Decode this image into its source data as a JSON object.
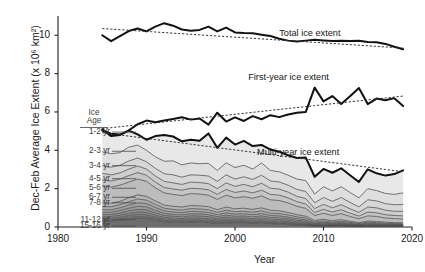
{
  "chart_data": {
    "type": "area",
    "title": "",
    "xlabel": "Year",
    "ylabel": "Dec-Feb Average Ice Extent (x 10⁶ km²)",
    "xlim": [
      1980,
      2020
    ],
    "ylim": [
      0,
      10.9
    ],
    "xticks": [
      1980,
      1990,
      2000,
      2010,
      2020
    ],
    "yticks": [
      0,
      2,
      4,
      6,
      8,
      10
    ],
    "grid": false,
    "legend_position": "inside-left",
    "x": [
      1985,
      1986,
      1987,
      1988,
      1989,
      1990,
      1991,
      1992,
      1993,
      1994,
      1995,
      1996,
      1997,
      1998,
      1999,
      2000,
      2001,
      2002,
      2003,
      2004,
      2005,
      2006,
      2007,
      2008,
      2009,
      2010,
      2011,
      2012,
      2013,
      2014,
      2015,
      2016,
      2017,
      2018,
      2019
    ],
    "series": [
      {
        "name": "Total ice extent",
        "style": "thick-solid",
        "values": [
          10.0,
          9.69,
          9.95,
          10.22,
          10.35,
          10.2,
          10.45,
          10.63,
          10.5,
          10.3,
          10.23,
          10.28,
          10.45,
          10.2,
          10.4,
          10.15,
          10.12,
          10.1,
          10.03,
          9.96,
          9.82,
          9.72,
          9.67,
          9.72,
          9.77,
          9.73,
          9.7,
          9.72,
          9.7,
          9.71,
          9.65,
          9.63,
          9.55,
          9.4,
          9.27
        ]
      },
      {
        "name": "Total ice extent trend",
        "style": "dotted-trend",
        "values": [
          10.35,
          10.32,
          10.29,
          10.26,
          10.23,
          10.2,
          10.17,
          10.14,
          10.11,
          10.08,
          10.05,
          10.02,
          9.99,
          9.96,
          9.93,
          9.9,
          9.87,
          9.84,
          9.81,
          9.78,
          9.75,
          9.72,
          9.69,
          9.66,
          9.63,
          9.6,
          9.57,
          9.54,
          9.51,
          9.48,
          9.45,
          9.42,
          9.39,
          9.36,
          9.33
        ]
      },
      {
        "name": "First-year ice extent",
        "style": "thick-solid",
        "values": [
          5.1,
          4.74,
          4.8,
          5.04,
          5.36,
          5.55,
          5.46,
          5.55,
          5.63,
          5.72,
          5.6,
          5.66,
          5.34,
          5.96,
          5.5,
          5.72,
          5.53,
          5.78,
          5.62,
          5.83,
          5.73,
          5.87,
          5.96,
          6.0,
          7.27,
          6.55,
          6.83,
          6.42,
          6.82,
          7.25,
          6.41,
          6.7,
          6.61,
          6.72,
          6.31
        ]
      },
      {
        "name": "First-year ice extent trend",
        "style": "dotted-trend",
        "values": [
          5.13,
          5.18,
          5.23,
          5.28,
          5.33,
          5.38,
          5.43,
          5.48,
          5.53,
          5.58,
          5.63,
          5.68,
          5.73,
          5.78,
          5.83,
          5.88,
          5.93,
          5.98,
          6.03,
          6.08,
          6.13,
          6.18,
          6.23,
          6.28,
          6.33,
          6.38,
          6.43,
          6.48,
          6.53,
          6.58,
          6.63,
          6.68,
          6.73,
          6.78,
          6.83
        ]
      },
      {
        "name": "Multi-year ice extent",
        "style": "thick-solid",
        "values": [
          5.03,
          4.86,
          4.82,
          5.03,
          4.83,
          4.55,
          4.74,
          4.8,
          4.72,
          4.47,
          4.55,
          4.5,
          4.88,
          4.13,
          4.66,
          4.3,
          4.49,
          4.22,
          4.28,
          4.04,
          3.93,
          3.74,
          3.6,
          3.62,
          2.62,
          3.03,
          2.83,
          3.06,
          2.7,
          2.35,
          3.01,
          2.8,
          2.68,
          2.76,
          2.95
        ]
      },
      {
        "name": "Multi-year ice extent trend",
        "style": "dotted-trend",
        "values": [
          4.92,
          4.86,
          4.8,
          4.74,
          4.68,
          4.62,
          4.56,
          4.5,
          4.44,
          4.38,
          4.32,
          4.26,
          4.2,
          4.14,
          4.08,
          4.02,
          3.96,
          3.9,
          3.84,
          3.78,
          3.72,
          3.66,
          3.6,
          3.54,
          3.48,
          3.42,
          3.36,
          3.3,
          3.24,
          3.18,
          3.12,
          3.06,
          3.0,
          2.94,
          2.88
        ]
      }
    ],
    "stacked_bands": [
      {
        "label": "1-2 yr",
        "values": [
          5.03,
          4.86,
          4.82,
          5.03,
          4.83,
          4.55,
          4.74,
          4.8,
          4.72,
          4.47,
          4.55,
          4.5,
          4.88,
          4.13,
          4.66,
          4.3,
          4.49,
          4.22,
          4.28,
          4.04,
          3.93,
          3.74,
          3.6,
          3.62,
          2.62,
          3.03,
          2.83,
          3.06,
          2.7,
          2.35,
          3.01,
          2.8,
          2.68,
          2.76,
          2.95
        ]
      },
      {
        "label": "2-3 yr",
        "values": [
          3.92,
          3.82,
          3.88,
          4.16,
          4.27,
          4.0,
          3.66,
          3.43,
          3.45,
          3.24,
          3.34,
          3.3,
          3.32,
          2.95,
          3.35,
          3.1,
          3.22,
          3.02,
          3.34,
          2.95,
          2.88,
          2.7,
          2.5,
          2.42,
          1.72,
          2.1,
          1.88,
          2.1,
          1.8,
          1.52,
          2.0,
          1.9,
          1.75,
          1.7,
          1.78
        ]
      },
      {
        "label": "3-4 yr",
        "values": [
          3.2,
          3.12,
          3.22,
          3.44,
          3.6,
          3.4,
          3.06,
          2.78,
          2.72,
          2.6,
          2.72,
          2.7,
          2.66,
          2.38,
          2.72,
          2.5,
          2.62,
          2.48,
          2.7,
          2.4,
          2.35,
          2.18,
          1.96,
          1.85,
          1.26,
          1.54,
          1.34,
          1.54,
          1.28,
          1.05,
          1.42,
          1.36,
          1.22,
          1.16,
          1.18
        ]
      },
      {
        "label": "4-5 yr",
        "values": [
          2.8,
          2.72,
          2.82,
          3.02,
          3.18,
          3.02,
          2.66,
          2.38,
          2.3,
          2.22,
          2.34,
          2.32,
          2.26,
          2.0,
          2.3,
          2.12,
          2.22,
          2.1,
          2.28,
          2.02,
          1.98,
          1.82,
          1.6,
          1.48,
          0.96,
          1.18,
          1.0,
          1.16,
          0.95,
          0.76,
          1.04,
          1.0,
          0.88,
          0.82,
          0.82
        ]
      },
      {
        "label": "5-6 yr",
        "values": [
          2.46,
          2.4,
          2.5,
          2.68,
          2.84,
          2.7,
          2.34,
          2.06,
          1.98,
          1.92,
          2.02,
          2.0,
          1.94,
          1.7,
          1.96,
          1.8,
          1.88,
          1.78,
          1.92,
          1.7,
          1.66,
          1.52,
          1.32,
          1.2,
          0.76,
          0.92,
          0.78,
          0.9,
          0.72,
          0.57,
          0.78,
          0.74,
          0.64,
          0.6,
          0.58
        ]
      },
      {
        "label": "6-7 yr",
        "values": [
          2.14,
          2.08,
          2.18,
          2.34,
          2.5,
          2.38,
          2.04,
          1.78,
          1.7,
          1.64,
          1.74,
          1.72,
          1.66,
          1.44,
          1.66,
          1.52,
          1.58,
          1.5,
          1.62,
          1.42,
          1.38,
          1.26,
          1.08,
          0.97,
          0.6,
          0.72,
          0.6,
          0.7,
          0.55,
          0.43,
          0.58,
          0.55,
          0.47,
          0.44,
          0.42
        ]
      },
      {
        "label": "7-8 yr",
        "values": [
          1.26,
          1.24,
          1.34,
          1.52,
          1.68,
          1.6,
          1.36,
          1.14,
          1.08,
          1.04,
          1.12,
          1.1,
          1.06,
          0.9,
          1.04,
          0.95,
          0.98,
          0.92,
          1.0,
          0.87,
          0.84,
          0.76,
          0.64,
          0.56,
          0.34,
          0.4,
          0.33,
          0.38,
          0.3,
          0.23,
          0.31,
          0.29,
          0.25,
          0.23,
          0.22
        ]
      },
      {
        "label": "8-9 yr",
        "values": [
          1.06,
          1.06,
          1.16,
          1.32,
          1.46,
          1.4,
          1.18,
          0.98,
          0.92,
          0.88,
          0.96,
          0.94,
          0.9,
          0.76,
          0.88,
          0.8,
          0.82,
          0.77,
          0.84,
          0.72,
          0.7,
          0.63,
          0.53,
          0.46,
          0.27,
          0.32,
          0.26,
          0.3,
          0.24,
          0.18,
          0.25,
          0.23,
          0.2,
          0.18,
          0.17
        ]
      },
      {
        "label": "9-10 yr",
        "values": [
          0.9,
          0.9,
          1.0,
          1.14,
          1.26,
          1.22,
          1.02,
          0.84,
          0.78,
          0.75,
          0.82,
          0.8,
          0.76,
          0.64,
          0.74,
          0.67,
          0.69,
          0.64,
          0.7,
          0.6,
          0.58,
          0.52,
          0.43,
          0.37,
          0.21,
          0.25,
          0.21,
          0.24,
          0.19,
          0.14,
          0.2,
          0.18,
          0.16,
          0.14,
          0.13
        ]
      },
      {
        "label": "10-11 yr",
        "values": [
          0.76,
          0.77,
          0.86,
          0.98,
          1.08,
          1.05,
          0.87,
          0.71,
          0.66,
          0.63,
          0.69,
          0.68,
          0.64,
          0.54,
          0.62,
          0.56,
          0.57,
          0.53,
          0.58,
          0.5,
          0.48,
          0.43,
          0.35,
          0.3,
          0.17,
          0.2,
          0.17,
          0.19,
          0.15,
          0.11,
          0.16,
          0.14,
          0.12,
          0.11,
          0.1
        ]
      },
      {
        "label": "11-12 yr",
        "values": [
          0.64,
          0.65,
          0.73,
          0.84,
          0.92,
          0.9,
          0.74,
          0.6,
          0.56,
          0.53,
          0.58,
          0.57,
          0.54,
          0.45,
          0.52,
          0.47,
          0.47,
          0.44,
          0.48,
          0.41,
          0.39,
          0.35,
          0.28,
          0.24,
          0.13,
          0.16,
          0.13,
          0.15,
          0.12,
          0.09,
          0.12,
          0.11,
          0.1,
          0.09,
          0.08
        ]
      },
      {
        "label": "12-13 yr",
        "values": [
          0.53,
          0.55,
          0.62,
          0.71,
          0.78,
          0.76,
          0.62,
          0.5,
          0.46,
          0.44,
          0.48,
          0.47,
          0.44,
          0.37,
          0.43,
          0.38,
          0.38,
          0.36,
          0.39,
          0.33,
          0.32,
          0.28,
          0.22,
          0.19,
          0.1,
          0.12,
          0.1,
          0.12,
          0.09,
          0.07,
          0.09,
          0.08,
          0.07,
          0.07,
          0.06
        ]
      },
      {
        "label": "13-14 yr",
        "values": [
          0.44,
          0.46,
          0.52,
          0.6,
          0.65,
          0.64,
          0.52,
          0.41,
          0.38,
          0.36,
          0.39,
          0.38,
          0.36,
          0.3,
          0.35,
          0.31,
          0.31,
          0.29,
          0.31,
          0.26,
          0.25,
          0.22,
          0.17,
          0.15,
          0.08,
          0.09,
          0.08,
          0.09,
          0.07,
          0.05,
          0.07,
          0.06,
          0.05,
          0.05,
          0.05
        ]
      },
      {
        "label": "14-15 yr",
        "values": [
          0.36,
          0.38,
          0.43,
          0.5,
          0.54,
          0.53,
          0.43,
          0.34,
          0.31,
          0.29,
          0.32,
          0.31,
          0.29,
          0.24,
          0.28,
          0.25,
          0.25,
          0.23,
          0.25,
          0.21,
          0.2,
          0.17,
          0.13,
          0.11,
          0.06,
          0.07,
          0.06,
          0.07,
          0.05,
          0.04,
          0.05,
          0.05,
          0.04,
          0.04,
          0.04
        ]
      },
      {
        "label": "15-16 yr",
        "values": [
          0.29,
          0.31,
          0.35,
          0.41,
          0.45,
          0.44,
          0.35,
          0.27,
          0.25,
          0.23,
          0.26,
          0.25,
          0.23,
          0.19,
          0.22,
          0.2,
          0.2,
          0.18,
          0.2,
          0.17,
          0.16,
          0.13,
          0.1,
          0.08,
          0.04,
          0.05,
          0.04,
          0.05,
          0.04,
          0.03,
          0.04,
          0.04,
          0.03,
          0.03,
          0.03
        ]
      }
    ],
    "age_labels": [
      {
        "label": "1-2 yr",
        "y": 4.95
      },
      {
        "label": "2-3 yr",
        "y": 3.95
      },
      {
        "label": "3-4 yr",
        "y": 3.2
      },
      {
        "label": "4-5 yr",
        "y": 2.52
      },
      {
        "label": "5-6 yr",
        "y": 2.02
      },
      {
        "label": "6-7 yr",
        "y": 1.55
      },
      {
        "label": "7-8 yr",
        "y": 1.26
      },
      {
        "label": "11-12 yr",
        "y": 0.38
      },
      {
        "label": "15-16 yr",
        "y": 0.05
      }
    ],
    "annotations": [
      {
        "text": "Total ice extent",
        "x": 2012.0,
        "y": 10.05
      },
      {
        "text": "First-year ice extent",
        "x": 2008.5,
        "y": 7.75
      },
      {
        "text": "Multi-year ice extent",
        "x": 2009.5,
        "y": 3.85
      },
      {
        "text": "Ice",
        "x": 1982.6,
        "y": 5.95
      },
      {
        "text": "Age",
        "x": 1982.6,
        "y": 5.55
      }
    ],
    "colors": {
      "line": "#111111",
      "trend": "#333333",
      "band_light": "#e8e8e8",
      "band_dark": "#6f6f6f",
      "axis": "#222222",
      "label": "#3a3a3a"
    }
  },
  "axes": {
    "y_title": "Dec-Feb Average Ice Extent (x 10⁶ km²)",
    "x_title": "Year",
    "y_ticklabels": [
      "10",
      "8",
      "6",
      "4",
      "2",
      "0"
    ],
    "x_ticklabels": [
      "1980",
      "1990",
      "2000",
      "2010",
      "2020"
    ]
  },
  "legend": {
    "head_line1": "Ice",
    "head_line2": "Age"
  }
}
